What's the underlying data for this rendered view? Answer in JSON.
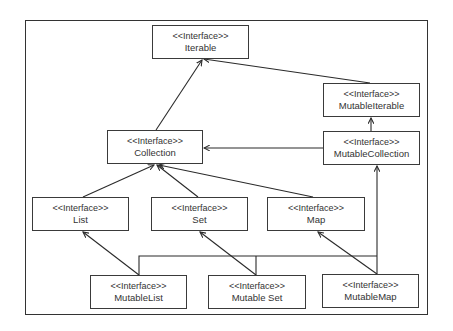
{
  "diagram": {
    "type": "uml-class-hierarchy",
    "stereotype": "<<Interface>>",
    "nodes": [
      {
        "id": "iterable",
        "stereotype": "<<Interface>>",
        "name": "Iterable",
        "x": 152,
        "y": 25,
        "w": 97,
        "h": 34
      },
      {
        "id": "mutable-iterable",
        "stereotype": "<<Interface>>",
        "name": "MutableIterable",
        "x": 323,
        "y": 83,
        "w": 97,
        "h": 34
      },
      {
        "id": "collection",
        "stereotype": "<<Interface>>",
        "name": "Collection",
        "x": 107,
        "y": 130,
        "w": 96,
        "h": 34
      },
      {
        "id": "mutable-collection",
        "stereotype": "<<Interface>>",
        "name": "MutableCollection",
        "x": 323,
        "y": 131,
        "w": 97,
        "h": 34
      },
      {
        "id": "list",
        "stereotype": "<<Interface>>",
        "name": "List",
        "x": 32,
        "y": 197,
        "w": 97,
        "h": 34
      },
      {
        "id": "set",
        "stereotype": "<<Interface>>",
        "name": "Set",
        "x": 151,
        "y": 197,
        "w": 97,
        "h": 34
      },
      {
        "id": "map",
        "stereotype": "<<Interface>>",
        "name": "Map",
        "x": 267,
        "y": 197,
        "w": 98,
        "h": 34
      },
      {
        "id": "mutable-list",
        "stereotype": "<<Interface>>",
        "name": "MutableList",
        "x": 90,
        "y": 275,
        "w": 97,
        "h": 34
      },
      {
        "id": "mutable-set",
        "stereotype": "<<Interface>>",
        "name": "Mutable Set",
        "x": 208,
        "y": 275,
        "w": 98,
        "h": 34
      },
      {
        "id": "mutable-map",
        "stereotype": "<<Interface>>",
        "name": "MutableMap",
        "x": 322,
        "y": 274,
        "w": 97,
        "h": 34
      }
    ],
    "edges": [
      {
        "from": "collection",
        "to": "iterable"
      },
      {
        "from": "mutable-iterable",
        "to": "iterable"
      },
      {
        "from": "mutable-collection",
        "to": "mutable-iterable"
      },
      {
        "from": "mutable-collection",
        "to": "collection"
      },
      {
        "from": "list",
        "to": "collection"
      },
      {
        "from": "set",
        "to": "collection"
      },
      {
        "from": "map",
        "to": "collection"
      },
      {
        "from": "mutable-list",
        "to": "list"
      },
      {
        "from": "mutable-set",
        "to": "set"
      },
      {
        "from": "mutable-map",
        "to": "map"
      },
      {
        "from": "mutable-list",
        "to": "mutable-collection",
        "routing": "orthogonal-bus"
      },
      {
        "from": "mutable-set",
        "to": "mutable-collection",
        "routing": "orthogonal-bus"
      },
      {
        "from": "mutable-map",
        "to": "mutable-collection",
        "routing": "orthogonal-bus"
      }
    ],
    "line_color": "#2a2a2a",
    "frame_color": "#333333"
  }
}
